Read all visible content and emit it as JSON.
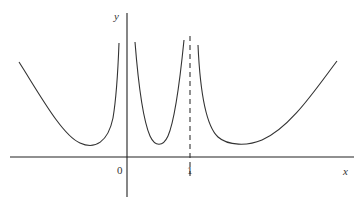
{
  "figure": {
    "type": "function-graph",
    "axis_labels": {
      "x": "x",
      "y": "y"
    },
    "tick_labels": {
      "origin": "0",
      "one": "1"
    },
    "vertical_asymptotes": [
      "x = 0",
      "x = 1 (dashed)"
    ],
    "branches": [
      {
        "name": "left-branch",
        "domain": "x < 0",
        "shape": "U-shaped, minimum above x-axis, rises to +inf near x=0"
      },
      {
        "name": "middle-branch",
        "domain": "0 < x < 1",
        "shape": "U-shaped, +inf at both asymptotes, minimum above x-axis"
      },
      {
        "name": "right-branch",
        "domain": "x > 1",
        "shape": "+inf near x=1, minimum above x-axis, rises for large x"
      }
    ],
    "colors": {
      "line": "#333333",
      "background": "#ffffff"
    }
  }
}
